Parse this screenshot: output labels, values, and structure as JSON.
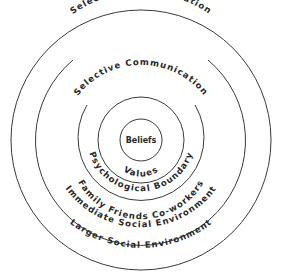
{
  "diagram": {
    "type": "concentric-circles",
    "center": {
      "x": 141,
      "y": 140
    },
    "rings": [
      {
        "id": "larger",
        "radius": 130
      },
      {
        "id": "immediate",
        "radius": 105
      },
      {
        "id": "psych-outer",
        "radius": 63
      },
      {
        "id": "values",
        "radius": 43
      },
      {
        "id": "beliefs",
        "radius": 21
      }
    ],
    "labels": {
      "outer_top": "Selective Communication",
      "inner_top": "Selective Communication",
      "beliefs": "Beliefs",
      "values": "Values",
      "psychological_boundary": "Psychological Boundary",
      "family_friends": "Family  Friends  Co-workers",
      "immediate": "Immediate Social Environment",
      "larger": "Larger Social Environment"
    },
    "stroke_color": "#3a3a3a"
  }
}
